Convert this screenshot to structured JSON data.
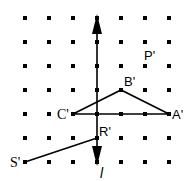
{
  "diagram": {
    "grid": {
      "origin_x": 25,
      "origin_y": 18,
      "spacing": 24,
      "cols": 7,
      "rows": 7,
      "dot_color": "#000000"
    },
    "mirror_line": {
      "label": "l",
      "col": 3,
      "top_arrow_row": 0,
      "bottom_arrow_row": 6
    },
    "points": {
      "A": {
        "label": "A'",
        "col": 6,
        "row": 4
      },
      "B": {
        "label": "B'",
        "col": 4,
        "row": 3
      },
      "C": {
        "label": "C'",
        "col": 2,
        "row": 4
      },
      "P": {
        "label": "P'",
        "col": 5,
        "row": 2
      },
      "R": {
        "label": "R'",
        "col": 3,
        "row": 5
      },
      "S": {
        "label": "S'",
        "col": 0,
        "row": 6
      }
    },
    "shapes": [
      {
        "type": "triangle",
        "vertices": [
          "A'",
          "B'",
          "C'"
        ]
      },
      {
        "type": "segment",
        "endpoints": [
          "R'",
          "S'"
        ]
      }
    ]
  }
}
